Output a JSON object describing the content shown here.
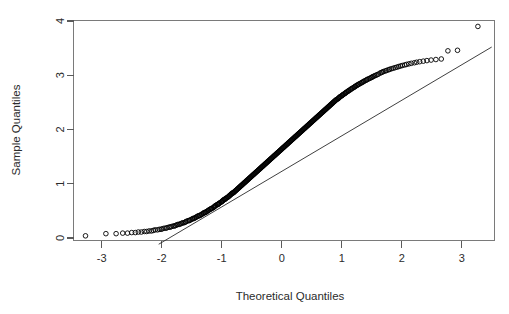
{
  "chart_data": {
    "type": "scatter",
    "title": "",
    "subtitle": "",
    "xlabel": "Theoretical Quantiles",
    "ylabel": "Sample Quantiles",
    "xlim": [
      -3.5,
      3.55
    ],
    "ylim": [
      -0.12,
      4.05
    ],
    "xticks": [
      -3,
      -2,
      -1,
      0,
      1,
      2,
      3
    ],
    "xtick_labels": [
      "-3",
      "-2",
      "-1",
      "0",
      "1",
      "2",
      "3"
    ],
    "yticks": [
      0,
      1,
      2,
      3,
      4
    ],
    "ytick_labels": [
      "0",
      "1",
      "2",
      "3",
      "4"
    ],
    "grid": false,
    "legend": false,
    "legend_position": "none",
    "point_marker": "open-circle",
    "point_radius_px": 2.3,
    "reference_line": {
      "label": "qqline",
      "x": [
        -2.05,
        3.5
      ],
      "y": [
        -0.115,
        3.52
      ],
      "slope": 0.655,
      "intercept": 1.228
    },
    "series": [
      {
        "name": "Sample Quantiles vs Theoretical Quantiles",
        "x": [
          -3.27,
          -2.93,
          -2.76,
          -2.65,
          -2.57,
          -2.5,
          -2.44,
          -2.39,
          -2.34,
          -2.29,
          -2.25,
          -2.21,
          -2.17,
          -2.14,
          -2.11,
          -2.07,
          -2.04,
          -2.01,
          -1.99,
          -1.96,
          -1.93,
          -1.91,
          -1.88,
          -1.86,
          -1.84,
          -1.81,
          -1.79,
          -1.77,
          -1.75,
          -1.73,
          -1.71,
          -1.69,
          -1.67,
          -1.65,
          -1.63,
          -1.61,
          -1.6,
          -1.58,
          -1.56,
          -1.54,
          -1.53,
          -1.51,
          -1.49,
          -1.48,
          -1.46,
          -1.45,
          -1.43,
          -1.42,
          -1.4,
          -1.39,
          -1.37,
          -1.36,
          -1.34,
          -1.33,
          -1.31,
          -1.3,
          -1.29,
          -1.27,
          -1.26,
          -1.25,
          -1.23,
          -1.22,
          -1.21,
          -1.19,
          -1.18,
          -1.17,
          -1.16,
          -1.14,
          -1.13,
          -1.12,
          -1.11,
          -1.1,
          -1.08,
          -1.07,
          -1.06,
          -1.05,
          -1.04,
          -1.03,
          -1.01,
          -1.0,
          -0.99,
          -0.98,
          -0.97,
          -0.96,
          -0.95,
          -0.94,
          -0.93,
          -0.92,
          -0.9,
          -0.89,
          -0.88,
          -0.87,
          -0.86,
          -0.85,
          -0.84,
          -0.83,
          -0.82,
          -0.81,
          -0.8,
          -0.79,
          -0.78,
          -0.77,
          -0.76,
          -0.75,
          -0.74,
          -0.73,
          -0.72,
          -0.71,
          -0.7,
          -0.69,
          -0.68,
          -0.67,
          -0.66,
          -0.65,
          -0.64,
          -0.63,
          -0.62,
          -0.61,
          -0.6,
          -0.59,
          -0.58,
          -0.57,
          -0.56,
          -0.55,
          -0.54,
          -0.53,
          -0.52,
          -0.51,
          -0.5,
          -0.49,
          -0.48,
          -0.47,
          -0.46,
          -0.45,
          -0.44,
          -0.43,
          -0.42,
          -0.41,
          -0.4,
          -0.39,
          -0.38,
          -0.37,
          -0.36,
          -0.35,
          -0.34,
          -0.33,
          -0.32,
          -0.31,
          -0.3,
          -0.29,
          -0.28,
          -0.27,
          -0.26,
          -0.25,
          -0.24,
          -0.23,
          -0.22,
          -0.21,
          -0.2,
          -0.19,
          -0.18,
          -0.17,
          -0.16,
          -0.15,
          -0.14,
          -0.13,
          -0.12,
          -0.11,
          -0.1,
          -0.09,
          -0.08,
          -0.07,
          -0.06,
          -0.05,
          -0.04,
          -0.03,
          -0.02,
          -0.01,
          0.0,
          0.01,
          0.02,
          0.03,
          0.04,
          0.05,
          0.06,
          0.07,
          0.08,
          0.09,
          0.1,
          0.11,
          0.12,
          0.13,
          0.14,
          0.15,
          0.16,
          0.17,
          0.18,
          0.19,
          0.2,
          0.21,
          0.22,
          0.23,
          0.24,
          0.25,
          0.26,
          0.27,
          0.28,
          0.29,
          0.3,
          0.31,
          0.32,
          0.33,
          0.34,
          0.35,
          0.36,
          0.37,
          0.38,
          0.39,
          0.4,
          0.41,
          0.42,
          0.43,
          0.44,
          0.45,
          0.46,
          0.47,
          0.48,
          0.49,
          0.5,
          0.51,
          0.52,
          0.53,
          0.54,
          0.55,
          0.56,
          0.57,
          0.58,
          0.59,
          0.6,
          0.61,
          0.62,
          0.63,
          0.64,
          0.65,
          0.66,
          0.67,
          0.68,
          0.69,
          0.7,
          0.71,
          0.72,
          0.73,
          0.74,
          0.75,
          0.76,
          0.77,
          0.78,
          0.79,
          0.8,
          0.81,
          0.82,
          0.83,
          0.84,
          0.85,
          0.86,
          0.87,
          0.88,
          0.89,
          0.9,
          0.91,
          0.93,
          0.94,
          0.95,
          0.96,
          0.97,
          0.98,
          1.0,
          1.01,
          1.02,
          1.03,
          1.05,
          1.06,
          1.07,
          1.08,
          1.1,
          1.11,
          1.12,
          1.14,
          1.15,
          1.16,
          1.18,
          1.19,
          1.21,
          1.22,
          1.23,
          1.25,
          1.26,
          1.28,
          1.29,
          1.31,
          1.33,
          1.34,
          1.36,
          1.37,
          1.39,
          1.41,
          1.42,
          1.44,
          1.46,
          1.48,
          1.5,
          1.51,
          1.53,
          1.55,
          1.57,
          1.59,
          1.61,
          1.64,
          1.66,
          1.68,
          1.7,
          1.73,
          1.75,
          1.78,
          1.8,
          1.83,
          1.86,
          1.89,
          1.92,
          1.95,
          1.98,
          2.01,
          2.05,
          2.08,
          2.12,
          2.16,
          2.21,
          2.25,
          2.3,
          2.36,
          2.42,
          2.49,
          2.57,
          2.66,
          2.77,
          2.93,
          3.27
        ],
        "y": [
          0.04,
          0.08,
          0.08,
          0.09,
          0.09,
          0.1,
          0.1,
          0.11,
          0.11,
          0.12,
          0.12,
          0.13,
          0.13,
          0.14,
          0.15,
          0.15,
          0.16,
          0.16,
          0.17,
          0.18,
          0.18,
          0.19,
          0.2,
          0.2,
          0.21,
          0.22,
          0.22,
          0.23,
          0.24,
          0.25,
          0.25,
          0.26,
          0.27,
          0.28,
          0.28,
          0.29,
          0.3,
          0.31,
          0.32,
          0.32,
          0.33,
          0.34,
          0.35,
          0.36,
          0.36,
          0.37,
          0.38,
          0.39,
          0.4,
          0.41,
          0.41,
          0.42,
          0.43,
          0.44,
          0.45,
          0.46,
          0.47,
          0.47,
          0.48,
          0.49,
          0.5,
          0.51,
          0.52,
          0.53,
          0.54,
          0.54,
          0.55,
          0.56,
          0.57,
          0.58,
          0.59,
          0.6,
          0.61,
          0.62,
          0.62,
          0.63,
          0.64,
          0.65,
          0.66,
          0.67,
          0.68,
          0.69,
          0.7,
          0.71,
          0.71,
          0.72,
          0.73,
          0.74,
          0.75,
          0.76,
          0.77,
          0.78,
          0.79,
          0.8,
          0.81,
          0.82,
          0.83,
          0.83,
          0.84,
          0.85,
          0.86,
          0.87,
          0.88,
          0.89,
          0.9,
          0.91,
          0.92,
          0.93,
          0.94,
          0.95,
          0.96,
          0.97,
          0.98,
          0.99,
          1.0,
          1.01,
          1.02,
          1.03,
          1.04,
          1.05,
          1.06,
          1.07,
          1.08,
          1.09,
          1.1,
          1.11,
          1.12,
          1.13,
          1.14,
          1.15,
          1.16,
          1.17,
          1.18,
          1.19,
          1.2,
          1.21,
          1.22,
          1.23,
          1.24,
          1.25,
          1.26,
          1.27,
          1.28,
          1.29,
          1.3,
          1.31,
          1.32,
          1.33,
          1.34,
          1.35,
          1.36,
          1.37,
          1.38,
          1.39,
          1.4,
          1.41,
          1.42,
          1.43,
          1.44,
          1.45,
          1.46,
          1.47,
          1.48,
          1.49,
          1.5,
          1.51,
          1.52,
          1.53,
          1.54,
          1.55,
          1.56,
          1.57,
          1.58,
          1.59,
          1.6,
          1.61,
          1.62,
          1.63,
          1.64,
          1.65,
          1.66,
          1.67,
          1.68,
          1.69,
          1.7,
          1.71,
          1.72,
          1.73,
          1.74,
          1.75,
          1.76,
          1.77,
          1.78,
          1.79,
          1.8,
          1.81,
          1.82,
          1.83,
          1.84,
          1.85,
          1.86,
          1.87,
          1.88,
          1.89,
          1.9,
          1.91,
          1.92,
          1.93,
          1.94,
          1.95,
          1.96,
          1.97,
          1.98,
          1.99,
          2.0,
          2.01,
          2.02,
          2.03,
          2.04,
          2.05,
          2.06,
          2.07,
          2.08,
          2.09,
          2.1,
          2.11,
          2.12,
          2.13,
          2.14,
          2.15,
          2.16,
          2.17,
          2.18,
          2.19,
          2.2,
          2.21,
          2.22,
          2.23,
          2.24,
          2.25,
          2.26,
          2.27,
          2.28,
          2.29,
          2.3,
          2.31,
          2.32,
          2.33,
          2.34,
          2.35,
          2.36,
          2.37,
          2.38,
          2.39,
          2.4,
          2.41,
          2.42,
          2.43,
          2.44,
          2.45,
          2.46,
          2.47,
          2.48,
          2.49,
          2.5,
          2.51,
          2.52,
          2.53,
          2.54,
          2.55,
          2.56,
          2.57,
          2.58,
          2.59,
          2.6,
          2.61,
          2.62,
          2.63,
          2.64,
          2.65,
          2.66,
          2.67,
          2.68,
          2.69,
          2.7,
          2.71,
          2.72,
          2.73,
          2.74,
          2.75,
          2.76,
          2.77,
          2.78,
          2.79,
          2.8,
          2.81,
          2.82,
          2.83,
          2.84,
          2.85,
          2.86,
          2.87,
          2.88,
          2.89,
          2.9,
          2.91,
          2.92,
          2.93,
          2.94,
          2.95,
          2.96,
          2.97,
          2.98,
          2.99,
          3.0,
          3.01,
          3.02,
          3.04,
          3.05,
          3.06,
          3.07,
          3.08,
          3.09,
          3.1,
          3.11,
          3.12,
          3.13,
          3.14,
          3.15,
          3.16,
          3.17,
          3.18,
          3.19,
          3.2,
          3.21,
          3.22,
          3.23,
          3.24,
          3.25,
          3.26,
          3.27,
          3.28,
          3.29,
          3.3,
          3.45,
          3.46,
          3.9
        ]
      }
    ]
  }
}
